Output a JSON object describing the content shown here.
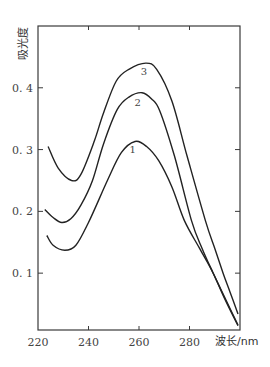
{
  "chart_data": {
    "type": "line",
    "title": "",
    "xlabel": "波长/nm",
    "ylabel": "吸光度",
    "xlim": [
      220,
      300
    ],
    "ylim": [
      0.008,
      0.5
    ],
    "x_ticks": [
      220,
      240,
      260,
      280
    ],
    "x_tick_labels": [
      "220",
      "240",
      "260",
      "280"
    ],
    "y_ticks": [
      0.1,
      0.2,
      0.3,
      0.4
    ],
    "y_tick_labels": [
      "0.1",
      "0.2",
      "0.3",
      "0.4"
    ],
    "grid": false,
    "legend": "inline labels near curve peaks",
    "series": [
      {
        "name": "1",
        "x": [
          223.5,
          226,
          230.6,
          235,
          240,
          247.5,
          253,
          258.4,
          263,
          267.8,
          273,
          278,
          284,
          289.4,
          294,
          299.2
        ],
        "y": [
          0.161,
          0.145,
          0.137,
          0.145,
          0.182,
          0.25,
          0.295,
          0.313,
          0.305,
          0.282,
          0.24,
          0.185,
          0.14,
          0.1,
          0.058,
          0.015
        ]
      },
      {
        "name": "2",
        "x": [
          222.7,
          226,
          229.4,
          233,
          237,
          241.6,
          246,
          251.4,
          256,
          261.2,
          265,
          268.2,
          274,
          280.8,
          285,
          289.4,
          294,
          299.2
        ],
        "y": [
          0.203,
          0.19,
          0.182,
          0.188,
          0.21,
          0.25,
          0.31,
          0.365,
          0.385,
          0.392,
          0.382,
          0.363,
          0.29,
          0.185,
          0.14,
          0.1,
          0.06,
          0.016
        ]
      },
      {
        "name": "3",
        "x": [
          224,
          228,
          233.3,
          237,
          242.4,
          246,
          251,
          256,
          262.7,
          267,
          273,
          279,
          286.3,
          290,
          293.3,
          296,
          299.2
        ],
        "y": [
          0.305,
          0.27,
          0.25,
          0.26,
          0.315,
          0.36,
          0.411,
          0.43,
          0.44,
          0.43,
          0.379,
          0.29,
          0.185,
          0.14,
          0.1,
          0.07,
          0.034
        ]
      }
    ],
    "series_label_positions": [
      {
        "name": "1",
        "x": 257.5,
        "y": 0.295
      },
      {
        "name": "2",
        "x": 259.5,
        "y": 0.37
      },
      {
        "name": "3",
        "x": 262,
        "y": 0.42
      }
    ]
  }
}
